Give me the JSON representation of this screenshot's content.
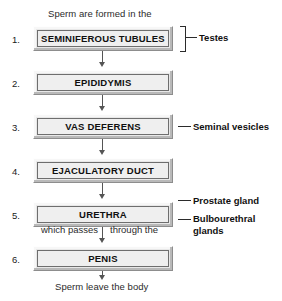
{
  "diagram": {
    "caption_top": "Sperm are formed in the",
    "caption_bottom": "Sperm leave the body",
    "mid_text_left": "which passes",
    "mid_text_right": "through the",
    "steps": [
      {
        "number": "1.",
        "label": "SEMINIFEROUS TUBULES"
      },
      {
        "number": "2.",
        "label": "EPIDIDYMIS"
      },
      {
        "number": "3.",
        "label": "VAS DEFERENS"
      },
      {
        "number": "4.",
        "label": "EJACULATORY DUCT"
      },
      {
        "number": "5.",
        "label": "URETHRA"
      },
      {
        "number": "6.",
        "label": "PENIS"
      }
    ],
    "annotations": [
      {
        "label": "Testes"
      },
      {
        "label": "Seminal vesicles"
      },
      {
        "label": "Prostate gland"
      },
      {
        "label": "Bulbourethral glands"
      }
    ],
    "colors": {
      "box_fill": "#efefef",
      "box_border": "#6e6e6e",
      "bevel_light": "#f7f7f7",
      "bevel_shadow": "#b9b9b9",
      "text": "#101010",
      "connector": "#555555",
      "background": "#ffffff"
    }
  }
}
